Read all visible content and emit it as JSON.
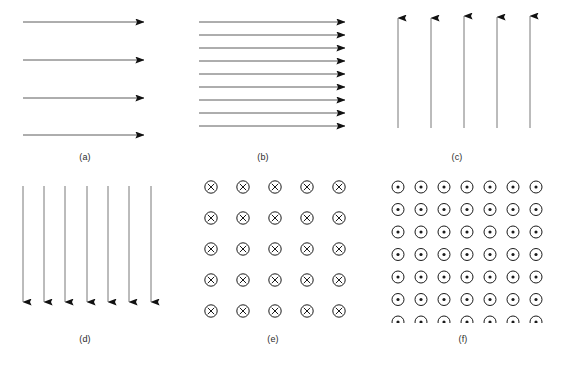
{
  "figure": {
    "background_color": "#ffffff",
    "stroke_color": "#1a1a1a",
    "label_color": "#2b2b2b",
    "width": 561,
    "height": 370
  },
  "panels": [
    {
      "id": "a",
      "label": "(a)",
      "kind": "arrows-right",
      "count": 4,
      "description": "Four widely spaced horizontal arrows pointing right"
    },
    {
      "id": "b",
      "label": "(b)",
      "kind": "arrows-right",
      "count": 9,
      "description": "Nine closely spaced horizontal arrows pointing right"
    },
    {
      "id": "c",
      "label": "(c)",
      "kind": "arrows-up",
      "count": 5,
      "description": "Five vertical arrows pointing up"
    },
    {
      "id": "d",
      "label": "(d)",
      "kind": "arrows-down",
      "count": 7,
      "description": "Seven vertical arrows pointing down"
    },
    {
      "id": "e",
      "label": "(e)",
      "kind": "grid-cross",
      "rows": 5,
      "columns": 5,
      "symbol": "circled-x",
      "description": "Five by five grid of circled X symbols, field into the page"
    },
    {
      "id": "f",
      "label": "(f)",
      "kind": "grid-dot",
      "rows": 7,
      "columns": 7,
      "symbol": "circled-dot",
      "description": "Seven by seven grid of circled dot symbols, field out of the page"
    }
  ]
}
